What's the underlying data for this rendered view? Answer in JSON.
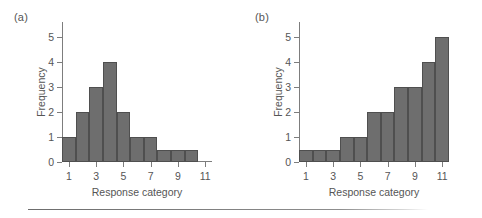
{
  "figure": {
    "panels": [
      {
        "label": "(a)",
        "name": "panel-a"
      },
      {
        "label": "(b)",
        "name": "panel-b"
      }
    ]
  },
  "chart_data": [
    {
      "type": "bar",
      "title": "(a)",
      "xlabel": "Response category",
      "ylabel": "Frequency",
      "categories": [
        1,
        2,
        3,
        4,
        5,
        6,
        7,
        8,
        9,
        10
      ],
      "values": [
        1,
        2,
        3,
        4,
        2,
        1,
        1,
        0.5,
        0.5,
        0.5
      ],
      "xlim": [
        0.5,
        11.5
      ],
      "ylim": [
        0,
        5.6
      ],
      "xticks": [
        1,
        3,
        5,
        7,
        9,
        11
      ],
      "xticklabels": [
        "1",
        "3",
        "5",
        "7",
        "9",
        "11"
      ],
      "yticks": [
        0,
        1,
        2,
        3,
        4,
        5
      ],
      "yticklabels": [
        "0",
        "1",
        "2",
        "3",
        "4",
        "5"
      ],
      "grid": false,
      "legend": false,
      "bar_color": "#6e6e6e",
      "bar_edge_color": "#4f4f4f"
    },
    {
      "type": "bar",
      "title": "(b)",
      "xlabel": "Response category",
      "ylabel": "Frequency",
      "categories": [
        1,
        2,
        3,
        4,
        5,
        6,
        7,
        8,
        9,
        10,
        11
      ],
      "values": [
        0.5,
        0.5,
        0.5,
        1,
        1,
        2,
        2,
        3,
        3,
        4,
        5
      ],
      "xlim": [
        0.5,
        11.5
      ],
      "ylim": [
        0,
        5.6
      ],
      "xticks": [
        1,
        3,
        5,
        7,
        9,
        11
      ],
      "xticklabels": [
        "1",
        "3",
        "5",
        "7",
        "9",
        "11"
      ],
      "yticks": [
        0,
        1,
        2,
        3,
        4,
        5
      ],
      "yticklabels": [
        "0",
        "1",
        "2",
        "3",
        "4",
        "5"
      ],
      "grid": false,
      "legend": false,
      "bar_color": "#6e6e6e",
      "bar_edge_color": "#4f4f4f"
    }
  ]
}
